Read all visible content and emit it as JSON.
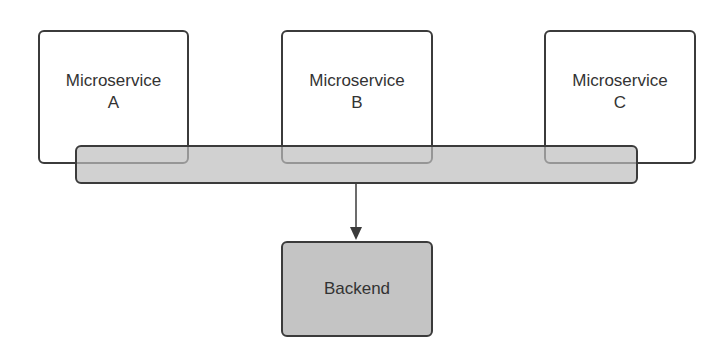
{
  "diagram": {
    "services": [
      {
        "line1": "Microservice",
        "line2": "A"
      },
      {
        "line1": "Microservice",
        "line2": "B"
      },
      {
        "line1": "Microservice",
        "line2": "C"
      }
    ],
    "bus": {
      "label": ""
    },
    "backend": {
      "label": "Backend"
    },
    "colors": {
      "border": "#3b3b3b",
      "bus_fill": "#d0d0d0",
      "backend_fill": "#c4c4c4",
      "service_fill": "#ffffff"
    }
  }
}
